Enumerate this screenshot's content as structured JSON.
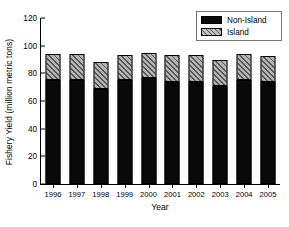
{
  "chart_data": {
    "type": "bar",
    "stacked": true,
    "title": "",
    "xlabel": "Year",
    "ylabel": "Fishery Yield (million metric tons)",
    "categories": [
      "1996",
      "1997",
      "1998",
      "1999",
      "2000",
      "2001",
      "2002",
      "2003",
      "2004",
      "2005"
    ],
    "series": [
      {
        "name": "Non-Island",
        "color": "#000000",
        "values": [
          75,
          75,
          69,
          75,
          76.5,
          74,
          74,
          70.5,
          75,
          74
        ]
      },
      {
        "name": "Island",
        "color": "#b4b4b4",
        "values": [
          19,
          19,
          19,
          18.5,
          18.5,
          19,
          19,
          19.5,
          19,
          18.5
        ]
      }
    ],
    "totals": [
      94,
      94,
      88,
      93.5,
      95,
      93,
      93,
      90,
      94,
      92.5
    ],
    "ylim": [
      0,
      120
    ],
    "yticks": [
      0,
      20,
      40,
      60,
      80,
      100,
      120
    ],
    "ytick_labels": [
      "0",
      "20",
      "40",
      "60",
      "80",
      "100",
      "120"
    ],
    "grid": false,
    "legend_position": "top-right",
    "legend": [
      {
        "label": "Non-Island",
        "swatch": "solid-black"
      },
      {
        "label": "Island",
        "swatch": "hatched-gray"
      }
    ]
  }
}
